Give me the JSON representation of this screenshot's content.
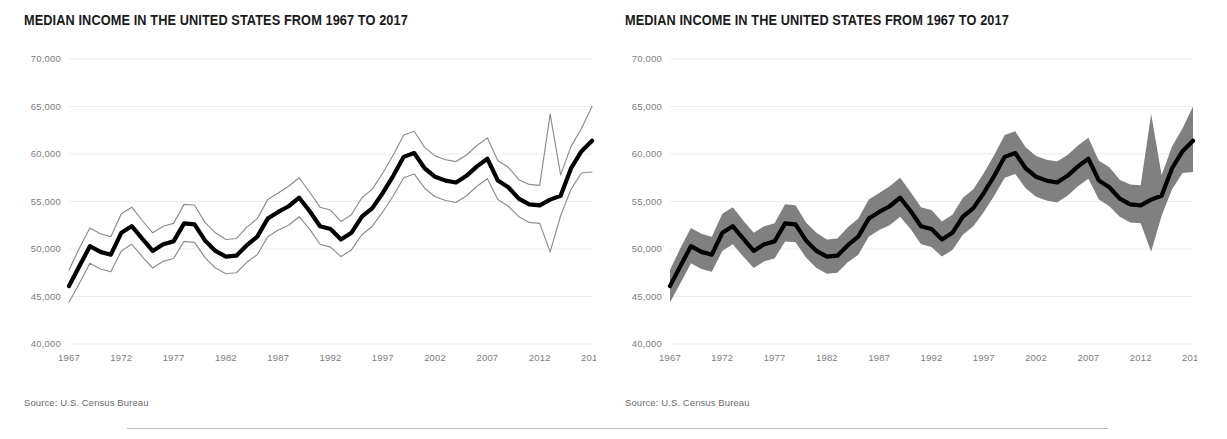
{
  "footer": {
    "rule": "divider"
  },
  "panels": [
    {
      "id": "left",
      "title": "MEDIAN INCOME IN THE UNITED STATES FROM 1967 TO 2017",
      "source": "Source: U.S. Census Bureau",
      "style": "lines"
    },
    {
      "id": "right",
      "title": "MEDIAN INCOME IN THE UNITED STATES FROM 1967 TO 2017",
      "source": "Source: U.S. Census Bureau",
      "style": "band"
    }
  ],
  "chart_data": [
    {
      "type": "line",
      "title": "MEDIAN INCOME IN THE UNITED STATES FROM 1967 TO 2017",
      "subtitle": "",
      "xlabel": "",
      "ylabel": "",
      "source": "Source: U.S. Census Bureau",
      "xlim": [
        1967,
        2017
      ],
      "ylim": [
        40000,
        70000
      ],
      "ytick_labels": [
        "40,000",
        "45,000",
        "50,000",
        "55,000",
        "60,000",
        "65,000",
        "70,000"
      ],
      "yticks": [
        40000,
        45000,
        50000,
        55000,
        60000,
        65000,
        70000
      ],
      "xtick_labels": [
        "1967",
        "1972",
        "1977",
        "1982",
        "1987",
        "1992",
        "1997",
        "2002",
        "2007",
        "2012",
        "2017"
      ],
      "xticks": [
        1967,
        1972,
        1977,
        1982,
        1987,
        1992,
        1997,
        2002,
        2007,
        2012,
        2017
      ],
      "grid": true,
      "legend": "none",
      "uncertainty_style": "upper and lower bound thin lines",
      "colors": {
        "median_line": "#000000",
        "bound_line": "#8c8c8c",
        "grid": "#ededed",
        "tick_text": "#7d7d7d",
        "title": "#1a1a1a"
      },
      "x": [
        1967,
        1968,
        1969,
        1970,
        1971,
        1972,
        1973,
        1974,
        1975,
        1976,
        1977,
        1978,
        1979,
        1980,
        1981,
        1982,
        1983,
        1984,
        1985,
        1986,
        1987,
        1988,
        1989,
        1990,
        1991,
        1992,
        1993,
        1994,
        1995,
        1996,
        1997,
        1998,
        1999,
        2000,
        2001,
        2002,
        2003,
        2004,
        2005,
        2006,
        2007,
        2008,
        2009,
        2010,
        2011,
        2012,
        2013,
        2014,
        2015,
        2016,
        2017
      ],
      "series": [
        {
          "name": "Median income",
          "role": "median",
          "values": [
            46100,
            48200,
            50300,
            49700,
            49400,
            51700,
            52400,
            51100,
            49800,
            50500,
            50800,
            52700,
            52600,
            50900,
            49800,
            49200,
            49300,
            50400,
            51300,
            53200,
            53900,
            54500,
            55400,
            54000,
            52400,
            52100,
            51000,
            51700,
            53400,
            54300,
            55900,
            57700,
            59700,
            60100,
            58500,
            57600,
            57200,
            57000,
            57700,
            58700,
            59500,
            57200,
            56500,
            55300,
            54700,
            54600,
            55200,
            55600,
            58500,
            60300,
            61400
          ]
        },
        {
          "name": "Upper bound",
          "role": "upper",
          "values": [
            47800,
            50100,
            52200,
            51600,
            51300,
            53700,
            54400,
            53000,
            51700,
            52400,
            52700,
            54700,
            54600,
            52800,
            51700,
            51000,
            51100,
            52300,
            53200,
            55200,
            55900,
            56600,
            57500,
            56000,
            54400,
            54100,
            52900,
            53600,
            55400,
            56300,
            58000,
            59900,
            62000,
            62400,
            60700,
            59800,
            59400,
            59200,
            59900,
            60900,
            61700,
            59300,
            58600,
            57300,
            56800,
            56700,
            64200,
            57800,
            60800,
            62700,
            65000
          ]
        },
        {
          "name": "Lower bound",
          "role": "lower",
          "values": [
            44400,
            46400,
            48500,
            47900,
            47600,
            49800,
            50500,
            49200,
            48000,
            48700,
            49000,
            50800,
            50700,
            49100,
            48000,
            47400,
            47500,
            48600,
            49400,
            51300,
            52000,
            52500,
            53400,
            52100,
            50500,
            50200,
            49200,
            49900,
            51500,
            52400,
            53900,
            55600,
            57500,
            57900,
            56400,
            55500,
            55100,
            54900,
            55600,
            56600,
            57400,
            55200,
            54500,
            53400,
            52800,
            52700,
            49700,
            53500,
            56300,
            58000,
            58100
          ]
        }
      ]
    },
    {
      "type": "area",
      "title": "MEDIAN INCOME IN THE UNITED STATES FROM 1967 TO 2017",
      "subtitle": "",
      "xlabel": "",
      "ylabel": "",
      "source": "Source: U.S. Census Bureau",
      "xlim": [
        1967,
        2017
      ],
      "ylim": [
        40000,
        70000
      ],
      "ytick_labels": [
        "40,000",
        "45,000",
        "50,000",
        "55,000",
        "60,000",
        "65,000",
        "70,000"
      ],
      "yticks": [
        40000,
        45000,
        50000,
        55000,
        60000,
        65000,
        70000
      ],
      "xtick_labels": [
        "1967",
        "1972",
        "1977",
        "1982",
        "1987",
        "1992",
        "1997",
        "2002",
        "2007",
        "2012",
        "2017"
      ],
      "xticks": [
        1967,
        1972,
        1977,
        1982,
        1987,
        1992,
        1997,
        2002,
        2007,
        2012,
        2017
      ],
      "grid": true,
      "legend": "none",
      "uncertainty_style": "shaded gray confidence band",
      "colors": {
        "median_line": "#000000",
        "band_fill": "#808080",
        "grid": "#ededed",
        "tick_text": "#7d7d7d",
        "title": "#1a1a1a"
      },
      "x": [
        1967,
        1968,
        1969,
        1970,
        1971,
        1972,
        1973,
        1974,
        1975,
        1976,
        1977,
        1978,
        1979,
        1980,
        1981,
        1982,
        1983,
        1984,
        1985,
        1986,
        1987,
        1988,
        1989,
        1990,
        1991,
        1992,
        1993,
        1994,
        1995,
        1996,
        1997,
        1998,
        1999,
        2000,
        2001,
        2002,
        2003,
        2004,
        2005,
        2006,
        2007,
        2008,
        2009,
        2010,
        2011,
        2012,
        2013,
        2014,
        2015,
        2016,
        2017
      ],
      "series": [
        {
          "name": "Median income",
          "role": "median",
          "values": [
            46100,
            48200,
            50300,
            49700,
            49400,
            51700,
            52400,
            51100,
            49800,
            50500,
            50800,
            52700,
            52600,
            50900,
            49800,
            49200,
            49300,
            50400,
            51300,
            53200,
            53900,
            54500,
            55400,
            54000,
            52400,
            52100,
            51000,
            51700,
            53400,
            54300,
            55900,
            57700,
            59700,
            60100,
            58500,
            57600,
            57200,
            57000,
            57700,
            58700,
            59500,
            57200,
            56500,
            55300,
            54700,
            54600,
            55200,
            55600,
            58500,
            60300,
            61400
          ]
        },
        {
          "name": "Upper bound",
          "role": "upper",
          "values": [
            47800,
            50100,
            52200,
            51600,
            51300,
            53700,
            54400,
            53000,
            51700,
            52400,
            52700,
            54700,
            54600,
            52800,
            51700,
            51000,
            51100,
            52300,
            53200,
            55200,
            55900,
            56600,
            57500,
            56000,
            54400,
            54100,
            52900,
            53600,
            55400,
            56300,
            58000,
            59900,
            62000,
            62400,
            60700,
            59800,
            59400,
            59200,
            59900,
            60900,
            61700,
            59300,
            58600,
            57300,
            56800,
            56700,
            64200,
            57800,
            60800,
            62700,
            65000
          ]
        },
        {
          "name": "Lower bound",
          "role": "lower",
          "values": [
            44400,
            46400,
            48500,
            47900,
            47600,
            49800,
            50500,
            49200,
            48000,
            48700,
            49000,
            50800,
            50700,
            49100,
            48000,
            47400,
            47500,
            48600,
            49400,
            51300,
            52000,
            52500,
            53400,
            52100,
            50500,
            50200,
            49200,
            49900,
            51500,
            52400,
            53900,
            55600,
            57500,
            57900,
            56400,
            55500,
            55100,
            54900,
            55600,
            56600,
            57400,
            55200,
            54500,
            53400,
            52800,
            52700,
            49700,
            53500,
            56300,
            58000,
            58100
          ]
        }
      ]
    }
  ]
}
